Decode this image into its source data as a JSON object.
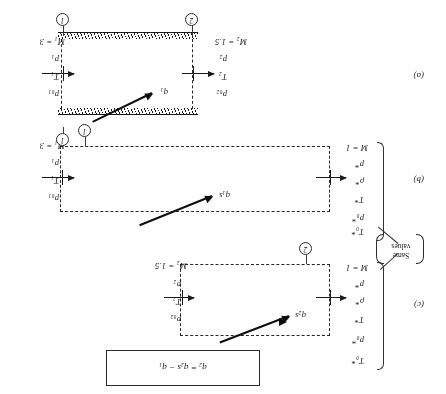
{
  "figure": {
    "orientation_note": "printed-upside-down",
    "panels": [
      {
        "tag": "(a)",
        "kind": "duct-with-solid-hatched-walls",
        "inlet": {
          "mach": "M₁ = 3",
          "props": [
            "p₁",
            "T₁",
            "p₀₁"
          ],
          "station": "1"
        },
        "outlet": {
          "mach": "M₂ = 1.5",
          "props": [
            "p₂",
            "T₂",
            "p₀₂"
          ],
          "station": "2"
        },
        "heat": "q₁"
      },
      {
        "tag": "(b)",
        "kind": "dashed-control-volume",
        "inlet": {
          "mach": "M₁ = 3",
          "props": [
            "p₁",
            "T₁",
            "p₀₁"
          ],
          "station": "1"
        },
        "outlet": {
          "mach": "M = 1",
          "props": [
            "p*",
            "ρ*",
            "T*",
            "p₀*",
            "T₀*"
          ]
        },
        "heat": "q₁s"
      },
      {
        "tag": "(c)",
        "kind": "dashed-control-volume",
        "inlet": {
          "mach": "M₂ = 1.5",
          "props": [
            "p₂",
            "T₂",
            "p₀₂"
          ],
          "station": "2"
        },
        "outlet": {
          "mach": "M = 1",
          "props": [
            "p*",
            "ρ*",
            "T*",
            "p₀*",
            "T₀*"
          ]
        },
        "heat": "q₂s"
      }
    ],
    "annotation": {
      "same_values_line1": "Same",
      "same_values_line2": "values"
    },
    "equation_box": {
      "text": "q₂ = q₂s − q₁"
    },
    "colors": {
      "ink": "#1c1c1c",
      "dash": "#2b2b2b",
      "paper": "#fefefe"
    }
  }
}
